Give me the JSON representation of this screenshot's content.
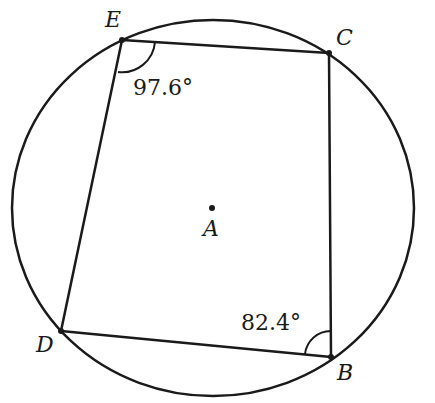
{
  "diagram": {
    "circle": {
      "center_label": "A"
    },
    "vertices": [
      {
        "label": "E"
      },
      {
        "label": "C"
      },
      {
        "label": "B"
      },
      {
        "label": "D"
      }
    ],
    "angles": [
      {
        "vertex": "E",
        "value": "97.6°"
      },
      {
        "vertex": "B",
        "value": "82.4°"
      }
    ],
    "colors": {
      "stroke": "#1a1a1a",
      "background": "#ffffff"
    }
  }
}
